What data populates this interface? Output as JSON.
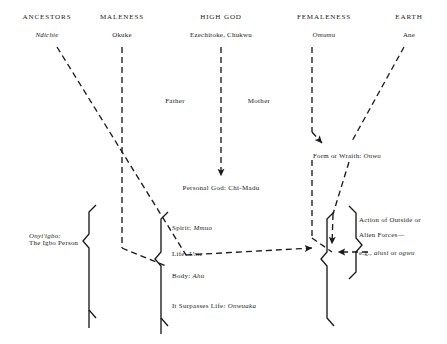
{
  "diagram": {
    "columns": [
      {
        "header": "ANCESTORS",
        "term": "Ndichie",
        "italic": true,
        "hx": 47,
        "tx": 47
      },
      {
        "header": "MALENESS",
        "term": "Okuke",
        "italic": false,
        "hx": 122,
        "tx": 122
      },
      {
        "header": "HIGH GOD",
        "term": "Ezechitoke, Chukwu",
        "italic": false,
        "hx": 221,
        "tx": 221
      },
      {
        "header": "FEMALENESS",
        "term": "Omumu",
        "italic": true,
        "hx": 324,
        "tx": 324
      },
      {
        "header": "EARTH",
        "term": "Ane",
        "italic": false,
        "hx": 409,
        "tx": 409
      }
    ],
    "mid_labels": [
      {
        "text": "Father",
        "x": 175,
        "y": 98
      },
      {
        "text": "Mother",
        "x": 259,
        "y": 98
      }
    ],
    "personal_god": {
      "text": "Personal God: Chi-Madu",
      "x": 221,
      "y": 185
    },
    "person_label": {
      "line1": "Onyi'igbo:",
      "line2": "The Igbo Person",
      "x": 29,
      "y": 232
    },
    "constituents": [
      {
        "label": "Spirit:",
        "term": "Mmuo",
        "y": 224
      },
      {
        "label": "Life:",
        "term": "Ume",
        "y": 250
      },
      {
        "label": "Body:",
        "term": "Ahu",
        "y": 272
      },
      {
        "label": "It Surpasses Life:",
        "term": "Onwuaka",
        "y": 302
      }
    ],
    "wraith": {
      "label": "Form or Wraith:",
      "term": "Onwu",
      "x": 313,
      "y": 152
    },
    "alien_forces": {
      "line1": "Action of Outside or",
      "line2": "Alien Forces—",
      "line3_prefix": "e.g., ",
      "line3_italic_a": "alusi",
      "line3_mid": " or ",
      "line3_italic_b": "ogwu",
      "x": 359,
      "y1": 216,
      "y2": 231,
      "y3": 249
    },
    "style": {
      "ink": "#1a1a1a",
      "stroke_width": 1.35,
      "dash_pattern": "6,4"
    }
  }
}
